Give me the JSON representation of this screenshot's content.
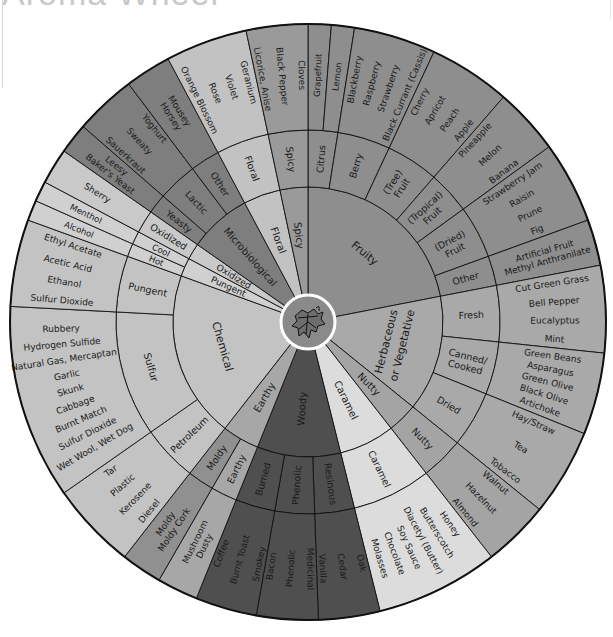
{
  "title": "Aroma Wheel",
  "wheel": {
    "center": [
      308,
      322
    ],
    "radii": {
      "hub": 27,
      "tier1": 135,
      "tier2": 192,
      "outer": 298
    },
    "hub_icon": "grape-leaf-icon",
    "colors": {
      "fruity": "#8e8e8e",
      "herb": "#a9a9a9",
      "nutty": "#a4a4a4",
      "caramel": "#dcdcdc",
      "woody": "#4f4f4f",
      "earthy": "#a7a7a7",
      "moldy": "#909090",
      "chemical": "#c3c3c3",
      "pungent": "#d0d0d0",
      "oxidized": "#c9c9c9",
      "micro": "#7e7e7e",
      "floral": "#c2c2c2",
      "spicy": "#9a9a9a"
    },
    "tier1": [
      {
        "label": "Fruity",
        "start": 0,
        "end": 79,
        "color": "fruity",
        "font": 11
      },
      {
        "label": "Herbaceous or Vegetative",
        "start": 79,
        "end": 129,
        "color": "herb",
        "font": 11,
        "two_line": [
          "Herbaceous",
          "or Vegetative"
        ]
      },
      {
        "label": "Nutty",
        "start": 129,
        "end": 142,
        "color": "nutty",
        "font": 10
      },
      {
        "label": "Caramel",
        "start": 142,
        "end": 166,
        "color": "caramel",
        "font": 10
      },
      {
        "label": "Woody",
        "start": 166,
        "end": 202,
        "color": "woody",
        "font": 10
      },
      {
        "label": "Earthy",
        "start": 202,
        "end": 218,
        "color": "earthy",
        "font": 10
      },
      {
        "label": "Chemical",
        "start": 218,
        "end": 290,
        "color": "chemical",
        "font": 11
      },
      {
        "label": "Pungent",
        "start": 290,
        "end": 298,
        "color": "pungent",
        "font": 9
      },
      {
        "label": "Oxidized",
        "start": 298,
        "end": 305,
        "color": "oxidized",
        "font": 9
      },
      {
        "label": "Microbiological",
        "start": 305,
        "end": 332,
        "color": "micro",
        "font": 10
      },
      {
        "label": "Floral",
        "start": 332,
        "end": 348,
        "color": "floral",
        "font": 10
      },
      {
        "label": "Spicy",
        "start": 348,
        "end": 360,
        "color": "spicy",
        "font": 10
      }
    ],
    "tier2": [
      {
        "label": "Citrus",
        "start": 0,
        "end": 9,
        "color": "fruity"
      },
      {
        "label": "Berry",
        "start": 9,
        "end": 25,
        "color": "fruity"
      },
      {
        "label": "(Tree) Fruit",
        "start": 25,
        "end": 41,
        "color": "fruity",
        "lines": [
          "(Tree)",
          "Fruit"
        ]
      },
      {
        "label": "(Tropical) Fruit",
        "start": 41,
        "end": 54,
        "color": "fruity",
        "lines": [
          "(Tropical)",
          "Fruit"
        ]
      },
      {
        "label": "(Dried) Fruit",
        "start": 54,
        "end": 70,
        "color": "fruity",
        "lines": [
          "(Dried)",
          "Fruit"
        ]
      },
      {
        "label": "Other",
        "start": 70,
        "end": 79,
        "color": "fruity"
      },
      {
        "label": "Fresh",
        "start": 79,
        "end": 96,
        "color": "herb"
      },
      {
        "label": "Canned/ Cooked",
        "start": 96,
        "end": 112,
        "color": "herb",
        "lines": [
          "Canned/",
          "Cooked"
        ]
      },
      {
        "label": "Dried",
        "start": 112,
        "end": 129,
        "color": "herb"
      },
      {
        "label": "Nutty",
        "start": 129,
        "end": 142,
        "color": "nutty"
      },
      {
        "label": "Caramel",
        "start": 142,
        "end": 166,
        "color": "caramel"
      },
      {
        "label": "Resinous",
        "start": 166,
        "end": 178,
        "color": "woody"
      },
      {
        "label": "Phenolic",
        "start": 178,
        "end": 190,
        "color": "woody"
      },
      {
        "label": "Burned",
        "start": 190,
        "end": 202,
        "color": "woody"
      },
      {
        "label": "Earthy",
        "start": 202,
        "end": 210,
        "color": "earthy"
      },
      {
        "label": "Moldy",
        "start": 210,
        "end": 218,
        "color": "moldy"
      },
      {
        "label": "Petroleum",
        "start": 218,
        "end": 235,
        "color": "chemical"
      },
      {
        "label": "Sulfur",
        "start": 235,
        "end": 273,
        "color": "chemical"
      },
      {
        "label": "Pungent",
        "start": 273,
        "end": 290,
        "color": "chemical"
      },
      {
        "label": "Hot",
        "start": 290,
        "end": 294,
        "color": "pungent"
      },
      {
        "label": "Cool",
        "start": 294,
        "end": 298,
        "color": "pungent"
      },
      {
        "label": "Oxidized",
        "start": 298,
        "end": 305,
        "color": "oxidized"
      },
      {
        "label": "Yeasty",
        "start": 305,
        "end": 311,
        "color": "micro"
      },
      {
        "label": "Lactic",
        "start": 311,
        "end": 323,
        "color": "micro"
      },
      {
        "label": "Other",
        "start": 323,
        "end": 332,
        "color": "micro"
      },
      {
        "label": "Floral",
        "start": 332,
        "end": 348,
        "color": "floral"
      },
      {
        "label": "Spicy",
        "start": 348,
        "end": 360,
        "color": "spicy"
      }
    ],
    "tier3": [
      {
        "start": 0,
        "end": 4.5,
        "color": "fruity",
        "items": [
          "Grapefruit"
        ]
      },
      {
        "start": 4.5,
        "end": 9,
        "color": "fruity",
        "items": [
          "Lemon"
        ]
      },
      {
        "start": 9,
        "end": 25,
        "color": "fruity",
        "items": [
          "Blackberry",
          "Raspberry",
          "Strawberry",
          "Black Currant (Cassis)"
        ]
      },
      {
        "start": 25,
        "end": 41,
        "color": "fruity",
        "items": [
          "Cherry",
          "Apricot",
          "Peach",
          "Apple"
        ]
      },
      {
        "start": 41,
        "end": 54,
        "color": "fruity",
        "items": [
          "Pineapple",
          "Melon",
          "Banana"
        ]
      },
      {
        "start": 54,
        "end": 70,
        "color": "fruity",
        "items": [
          "Strawberry Jam",
          "Raisin",
          "Prune",
          "Fig"
        ]
      },
      {
        "start": 70,
        "end": 79,
        "color": "fruity",
        "items": [
          "Artificial Fruit",
          "Methyl Anthranilate"
        ]
      },
      {
        "start": 79,
        "end": 96,
        "color": "herb",
        "items": [
          "Cut Green Grass",
          "Bell Pepper",
          "Eucalyptus",
          "Mint"
        ]
      },
      {
        "start": 96,
        "end": 112,
        "color": "herb",
        "items": [
          "Green Beans",
          "Asparagus",
          "Green Olive",
          "Black Olive",
          "Artichoke"
        ]
      },
      {
        "start": 112,
        "end": 129,
        "color": "herb",
        "items": [
          "Hay/Straw",
          "Tea",
          "Tobacco"
        ]
      },
      {
        "start": 129,
        "end": 142,
        "color": "nutty",
        "items": [
          "Walnut",
          "Hazelnut",
          "Almond"
        ]
      },
      {
        "start": 142,
        "end": 166,
        "color": "caramel",
        "items": [
          "Honey",
          "Butterscotch",
          "Diacetyl (Butter)",
          "Soy Sauce",
          "Chocolate",
          "Molasses"
        ]
      },
      {
        "start": 166,
        "end": 178,
        "color": "woody",
        "items": [
          "Oak",
          "Cedar",
          "Vanilla"
        ]
      },
      {
        "start": 178,
        "end": 190,
        "color": "woody",
        "items": [
          "Medicinal",
          "Phenolic",
          "Bacon"
        ]
      },
      {
        "start": 190,
        "end": 202,
        "color": "woody",
        "items": [
          "Smokey",
          "Burnt Toast",
          "Coffee"
        ]
      },
      {
        "start": 202,
        "end": 210,
        "color": "earthy",
        "items": [
          "Mushroom",
          "Dusty"
        ]
      },
      {
        "start": 210,
        "end": 218,
        "color": "moldy",
        "items": [
          "Moldy",
          "Moldy Cork"
        ]
      },
      {
        "start": 218,
        "end": 235,
        "color": "chemical",
        "items": [
          "Diesel",
          "Kerosene",
          "Plastic",
          "Tar"
        ]
      },
      {
        "start": 235,
        "end": 273,
        "color": "chemical",
        "items": [
          "Wet Wool, Wet Dog",
          "Sulfur Dioxide",
          "Burnt Match",
          "Cabbage",
          "Skunk",
          "Garlic",
          "Natural Gas, Mercaptan",
          "Hydrogen Sulfide",
          "Rubbery"
        ]
      },
      {
        "start": 273,
        "end": 290,
        "color": "chemical",
        "items": [
          "Sulfur Dioxide",
          "Ethanol",
          "Acetic Acid",
          "Ethyl Acetate"
        ]
      },
      {
        "start": 290,
        "end": 294,
        "color": "pungent",
        "items": [
          "Alcohol"
        ]
      },
      {
        "start": 294,
        "end": 298,
        "color": "pungent",
        "items": [
          "Menthol"
        ]
      },
      {
        "start": 298,
        "end": 305,
        "color": "oxidized",
        "items": [
          "Sherry"
        ]
      },
      {
        "start": 305,
        "end": 311,
        "color": "micro",
        "items": [
          "Leesy",
          "Baker's Yeast"
        ]
      },
      {
        "start": 311,
        "end": 323,
        "color": "micro",
        "items": [
          "Sauerkraut",
          "Sweaty",
          "Yoghurt"
        ]
      },
      {
        "start": 323,
        "end": 332,
        "color": "micro",
        "items": [
          "Mousey",
          "Horsey"
        ]
      },
      {
        "start": 332,
        "end": 348,
        "color": "floral",
        "items": [
          "Orange Blossom",
          "Rose",
          "Violet",
          "Geranium"
        ]
      },
      {
        "start": 348,
        "end": 360,
        "color": "spicy",
        "items": [
          "Licorice, Anise",
          "Black Pepper",
          "Cloves"
        ]
      }
    ]
  }
}
